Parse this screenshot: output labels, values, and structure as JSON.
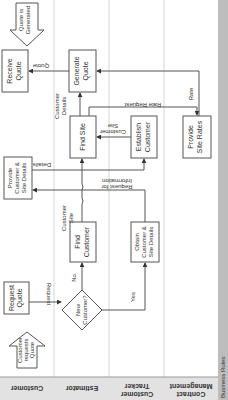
{
  "diagram": {
    "type": "swimlane flowchart (rotated 90 degrees)",
    "lanes": [
      {
        "label": "Customer"
      },
      {
        "label": "Estimator"
      },
      {
        "label_line1": "Customer",
        "label_line2": "Tracker"
      },
      {
        "label_line1": "Contract",
        "label_line2": "Management"
      }
    ],
    "footer": {
      "label": "Business Rules:"
    },
    "start_event": {
      "line1": "Customer",
      "line2": "requests",
      "line3": "Quote"
    },
    "end_event": {
      "line1": "Quote is",
      "line2": "Generated"
    },
    "nodes": {
      "request_quote": {
        "line1": "Request",
        "line2": "Quote"
      },
      "new_customer": {
        "line1": "New",
        "line2": "Customer?"
      },
      "find_customer": {
        "line1": "Find",
        "line2": "Customer"
      },
      "obtain_details": {
        "line1": "Obtain",
        "line2": "Customer &",
        "line3": "Site Details"
      },
      "provide_details": {
        "line1": "Provide",
        "line2": "Customer &",
        "line3": "Site Details"
      },
      "find_site": {
        "line1": "Find Site"
      },
      "establish_customer": {
        "line1": "Establish",
        "line2": "Customer"
      },
      "provide_site_rates": {
        "line1": "Provide",
        "line2": "Site Rates"
      },
      "generate_quote": {
        "line1": "Generate",
        "line2": "Quote"
      },
      "receive_quote": {
        "line1": "Receive",
        "line2": "Quote"
      }
    },
    "edges": {
      "request": "Request",
      "no": "No",
      "yes": "Yes",
      "customer_site_1_line1": "Customer",
      "customer_site_1_line2": "Site",
      "request_info_line1": "Request for",
      "request_info_line2": "Information",
      "details": "Details",
      "customer_site_2_line1": "Customer",
      "customer_site_2_line2": "Site",
      "customer_details_line1": "Customer",
      "customer_details_line2": "Details",
      "rate_request": "Rate Request",
      "rate": "Rate",
      "quote": "Quote"
    }
  }
}
